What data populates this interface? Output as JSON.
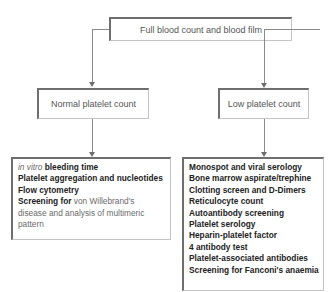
{
  "top": {
    "label": "Full blood count and blood film"
  },
  "branches": [
    {
      "label": "Normal platelet count",
      "items": [
        {
          "parts": [
            {
              "text": "in vitro",
              "style": "italic"
            },
            {
              "text": " bleeding time",
              "style": "bold"
            }
          ]
        },
        {
          "parts": [
            {
              "text": "Platelet aggregation and nucleotides",
              "style": "bold"
            }
          ]
        },
        {
          "parts": [
            {
              "text": "Flow cytometry",
              "style": "bold"
            }
          ]
        },
        {
          "parts": [
            {
              "text": "Screening for",
              "style": "bold"
            },
            {
              "text": " von Willebrand's disease and analysis of multimeric pattern",
              "style": "normal"
            }
          ]
        }
      ]
    },
    {
      "label": "Low platelet count",
      "items": [
        {
          "parts": [
            {
              "text": "Monospot and viral serology",
              "style": "bold"
            }
          ]
        },
        {
          "parts": [
            {
              "text": "Bone marrow aspirate/trephine",
              "style": "bold"
            }
          ]
        },
        {
          "parts": [
            {
              "text": "Clotting screen and D-Dimers",
              "style": "bold"
            }
          ]
        },
        {
          "parts": [
            {
              "text": "Reticulocyte count",
              "style": "bold"
            }
          ]
        },
        {
          "parts": [
            {
              "text": "Autoantibody screening",
              "style": "bold"
            }
          ]
        },
        {
          "parts": [
            {
              "text": "Platelet serology",
              "style": "bold"
            }
          ]
        },
        {
          "parts": [
            {
              "text": "Heparin-platelet factor",
              "style": "bold"
            }
          ]
        },
        {
          "parts": [
            {
              "text": "4 antibody test",
              "style": "bold"
            }
          ]
        },
        {
          "parts": [
            {
              "text": "Platelet-associated antibodies",
              "style": "bold"
            }
          ]
        },
        {
          "parts": [
            {
              "text": "Screening for Fanconi's anaemia",
              "style": "bold"
            }
          ]
        }
      ]
    }
  ],
  "colors": {
    "border_dark": "#6e6e6e",
    "border_light": "#c4c4c4",
    "connector": "#8a8a8a"
  }
}
